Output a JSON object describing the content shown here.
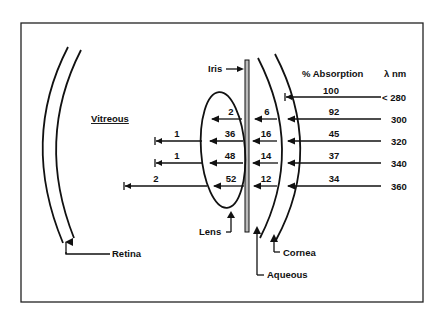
{
  "figure": {
    "headers": {
      "absorption": "% Absorption",
      "wavelength": "λ nm"
    },
    "labels": {
      "vitreous": "Vitreous",
      "iris": "Iris",
      "lens": "Lens",
      "retina": "Retina",
      "cornea": "Cornea",
      "aqueous": "Aqueous"
    },
    "rows": [
      {
        "wavelength": "< 280",
        "cornea": "100",
        "aqueous": "",
        "lens": "",
        "vitreous": ""
      },
      {
        "wavelength": "300",
        "cornea": "92",
        "aqueous": "6",
        "lens": "2",
        "vitreous": ""
      },
      {
        "wavelength": "320",
        "cornea": "45",
        "aqueous": "16",
        "lens": "36",
        "vitreous": "1"
      },
      {
        "wavelength": "340",
        "cornea": "37",
        "aqueous": "14",
        "lens": "48",
        "vitreous": "1"
      },
      {
        "wavelength": "360",
        "cornea": "34",
        "aqueous": "12",
        "lens": "52",
        "vitreous": "2"
      }
    ],
    "colors": {
      "ink": "#111111",
      "background": "#ffffff"
    }
  }
}
